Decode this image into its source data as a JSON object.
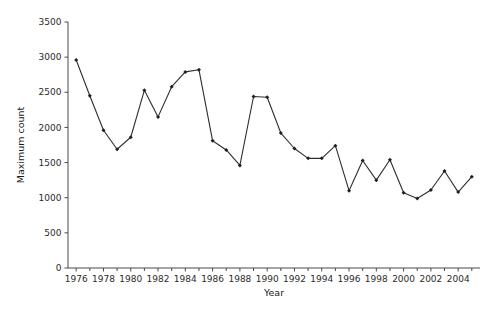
{
  "chart_data": {
    "type": "line",
    "title": "",
    "subtitle": "",
    "xlabel": "Year",
    "ylabel": "Maximum count",
    "xlim": [
      1975.4,
      2005.6
    ],
    "ylim": [
      0,
      3500
    ],
    "grid": false,
    "legend": null,
    "legend_position": "none",
    "marker": "filled-diamond",
    "line_color": "#2e2e2e",
    "marker_color": "#1f1f1f",
    "x_tick_labels": [
      "1976",
      "1978",
      "1980",
      "1982",
      "1984",
      "1986",
      "1988",
      "1990",
      "1992",
      "1994",
      "1996",
      "1998",
      "2000",
      "2002",
      "2004"
    ],
    "x_tick_values": [
      1976,
      1978,
      1980,
      1982,
      1984,
      1986,
      1988,
      1990,
      1992,
      1994,
      1996,
      1998,
      2000,
      2002,
      2004
    ],
    "x_minor_tick_values": [
      1977,
      1979,
      1981,
      1983,
      1985,
      1987,
      1989,
      1991,
      1993,
      1995,
      1997,
      1999,
      2001,
      2003,
      2005
    ],
    "y_tick_labels": [
      "0",
      "500",
      "1000",
      "1500",
      "2000",
      "2500",
      "3000",
      "3500"
    ],
    "y_tick_values": [
      0,
      500,
      1000,
      1500,
      2000,
      2500,
      3000,
      3500
    ],
    "x": [
      1976,
      1977,
      1978,
      1979,
      1980,
      1981,
      1982,
      1983,
      1984,
      1985,
      1986,
      1987,
      1988,
      1989,
      1990,
      1991,
      1992,
      1993,
      1994,
      1995,
      1996,
      1997,
      1998,
      1999,
      2000,
      2001,
      2002,
      2003,
      2004,
      2005
    ],
    "values": [
      2960,
      2450,
      1960,
      1690,
      1860,
      2530,
      2150,
      2580,
      2790,
      2820,
      1810,
      1680,
      1460,
      2440,
      2430,
      1920,
      1700,
      1560,
      1560,
      1740,
      1100,
      1530,
      1250,
      1540,
      1070,
      990,
      1110,
      1380,
      1080,
      1300
    ],
    "series": [
      {
        "name": "Maximum count",
        "values": [
          2960,
          2450,
          1960,
          1690,
          1860,
          2530,
          2150,
          2580,
          2790,
          2820,
          1810,
          1680,
          1460,
          2440,
          2430,
          1920,
          1700,
          1560,
          1560,
          1740,
          1100,
          1530,
          1250,
          1540,
          1070,
          990,
          1110,
          1380,
          1080,
          1300
        ]
      }
    ]
  }
}
